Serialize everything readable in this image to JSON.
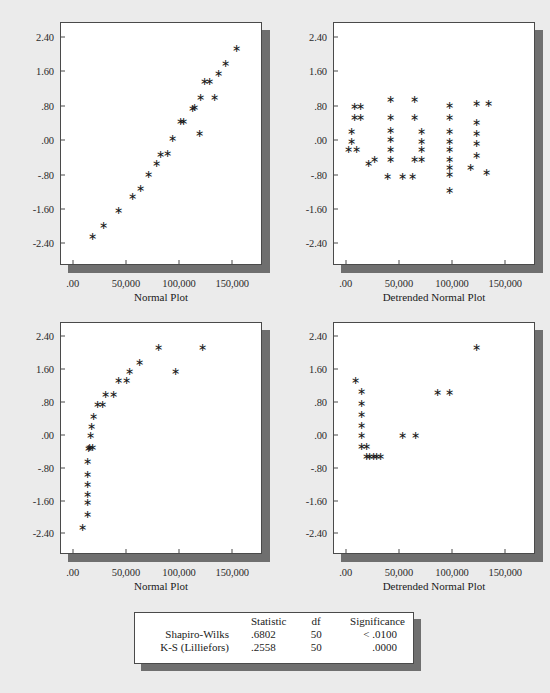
{
  "figure": {
    "background_color": "#ebebeb",
    "shadow_color": "#6f6f6f",
    "marker_glyph": "∗",
    "marker_color": "#171717"
  },
  "chart_data": [
    {
      "id": "normal-plot-top-left",
      "type": "scatter",
      "title": "",
      "xlabel": "Normal Plot",
      "ylabel": "",
      "xlim": [
        -12000,
        178000
      ],
      "ylim": [
        -2.9,
        2.75
      ],
      "xticks": [
        0,
        50000,
        100000,
        150000
      ],
      "xticklabels": [
        ".00",
        "50,000",
        "100,000",
        "150,000"
      ],
      "yticks": [
        2.4,
        1.6,
        0.8,
        0.0,
        -0.8,
        -1.6,
        -2.4
      ],
      "yticklabels": [
        "2.40",
        "1.60",
        ".80",
        ".00",
        "-.80",
        "-1.60",
        "-2.40"
      ],
      "grid": false,
      "legend": "none",
      "x": [
        18000,
        28000,
        42000,
        55000,
        63000,
        70000,
        78000,
        82000,
        88000,
        93000,
        100000,
        103000,
        112000,
        114000,
        118000,
        119000,
        123000,
        128000,
        132000,
        136000,
        143000,
        153000
      ],
      "y": [
        -2.22,
        -1.95,
        -1.62,
        -1.28,
        -1.1,
        -0.77,
        -0.52,
        -0.3,
        -0.28,
        0.06,
        0.47,
        0.47,
        0.77,
        0.78,
        0.18,
        1.02,
        1.38,
        1.38,
        1.02,
        1.57,
        1.8,
        2.15
      ]
    },
    {
      "id": "detrended-normal-plot-top-right",
      "type": "scatter",
      "title": "",
      "xlabel": "Detrended Normal Plot",
      "ylabel": "",
      "xlim": [
        -12000,
        178000
      ],
      "ylim": [
        -2.9,
        2.75
      ],
      "xticks": [
        0,
        50000,
        100000,
        150000
      ],
      "xticklabels": [
        ".00",
        "50,000",
        "100,000",
        "150,000"
      ],
      "yticks": [
        2.4,
        1.6,
        0.8,
        0.0,
        -0.8,
        -1.6,
        -2.4
      ],
      "yticklabels": [
        "2.40",
        "1.60",
        ".80",
        ".00",
        "-.80",
        "-1.60",
        "-2.40"
      ],
      "grid": false,
      "legend": "none",
      "x": [
        7000,
        7000,
        4000,
        4000,
        2000,
        9000,
        13000,
        13000,
        20000,
        26000,
        38000,
        41000,
        41000,
        41000,
        41000,
        41000,
        41000,
        52000,
        62000,
        64000,
        64000,
        64000,
        70000,
        70000,
        70000,
        70000,
        97000,
        97000,
        97000,
        97000,
        97000,
        97000,
        97000,
        97000,
        97000,
        116000,
        122000,
        122000,
        122000,
        122000,
        122000,
        131000,
        133000
      ],
      "y": [
        0.8,
        0.55,
        0.23,
        0.0,
        -0.18,
        -0.18,
        0.8,
        0.55,
        -0.52,
        -0.42,
        -0.83,
        0.98,
        0.55,
        0.25,
        0.03,
        -0.18,
        -0.42,
        -0.83,
        -0.83,
        0.98,
        0.55,
        -0.42,
        0.23,
        0.0,
        -0.18,
        -0.42,
        0.84,
        0.55,
        0.23,
        0.0,
        -0.18,
        -0.42,
        -0.78,
        -1.15,
        -0.6,
        -0.6,
        0.44,
        0.18,
        -0.05,
        -0.32,
        0.88,
        -0.72,
        0.88
      ]
    },
    {
      "id": "normal-plot-bottom-left",
      "type": "scatter",
      "title": "",
      "xlabel": "Normal Plot",
      "ylabel": "",
      "xlim": [
        -12000,
        178000
      ],
      "ylim": [
        -2.9,
        2.75
      ],
      "xticks": [
        0,
        50000,
        100000,
        150000
      ],
      "xticklabels": [
        ".00",
        "50,000",
        "100,000",
        "150,000"
      ],
      "yticks": [
        2.4,
        1.6,
        0.8,
        0.0,
        -0.8,
        -1.6,
        -2.4
      ],
      "yticklabels": [
        "2.40",
        "1.60",
        ".80",
        ".00",
        "-.80",
        "-1.60",
        "-2.40"
      ],
      "grid": false,
      "legend": "none",
      "x": [
        8000,
        13000,
        13000,
        13000,
        13000,
        13000,
        13000,
        14000,
        15000,
        18000,
        16000,
        17000,
        19000,
        22000,
        27000,
        30000,
        37000,
        42000,
        50000,
        52000,
        62000,
        80000,
        96000,
        121000
      ],
      "y": [
        -2.22,
        -1.92,
        -1.63,
        -1.42,
        -1.18,
        -0.95,
        -0.62,
        -0.3,
        -0.28,
        -0.28,
        0.0,
        0.22,
        0.47,
        0.77,
        0.77,
        1.02,
        1.02,
        1.35,
        1.35,
        1.57,
        1.8,
        2.15,
        1.57,
        2.15
      ]
    },
    {
      "id": "detrended-normal-plot-bottom-right",
      "type": "scatter",
      "title": "",
      "xlabel": "Detrended Normal Plot",
      "ylabel": "",
      "xlim": [
        -12000,
        178000
      ],
      "ylim": [
        -2.9,
        2.75
      ],
      "xticks": [
        0,
        50000,
        100000,
        150000
      ],
      "xticklabels": [
        ".00",
        "50,000",
        "100,000",
        "150,000"
      ],
      "yticks": [
        2.4,
        1.6,
        0.8,
        0.0,
        -0.8,
        -1.6,
        -2.4
      ],
      "yticklabels": [
        "2.40",
        "1.60",
        ".80",
        ".00",
        "-.80",
        "-1.60",
        "-2.40"
      ],
      "grid": false,
      "legend": "none",
      "x": [
        8000,
        14000,
        14000,
        14000,
        14000,
        14000,
        14000,
        19000,
        19000,
        21000,
        25000,
        28000,
        32000,
        52000,
        65000,
        85000,
        97000,
        122000
      ],
      "y": [
        1.35,
        1.08,
        0.8,
        0.53,
        0.25,
        0.0,
        -0.25,
        -0.25,
        -0.5,
        -0.5,
        -0.5,
        -0.5,
        -0.5,
        0.0,
        0.0,
        1.05,
        1.05,
        2.15
      ]
    }
  ],
  "stats_table": {
    "columns": [
      "",
      "Statistic",
      "df",
      "Significance"
    ],
    "rows": [
      {
        "label": "Shapiro-Wilks",
        "statistic": ".6802",
        "df": "50",
        "significance": "< .0100"
      },
      {
        "label": "K-S (Lilliefors)",
        "statistic": ".2558",
        "df": "50",
        "significance": ".0000"
      }
    ]
  }
}
